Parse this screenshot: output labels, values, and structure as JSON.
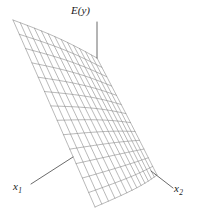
{
  "figure": {
    "type": "3d-response-surface-wireframe",
    "width": 197,
    "height": 219,
    "background_color": "#ffffff",
    "mesh_line_color": "#8a8a8a",
    "leader_line_color": "#595959",
    "text_color": "#1a1a1a"
  },
  "labels": {
    "response": "E(y)",
    "factor_1": "x",
    "factor_1_sub": "1",
    "factor_2": "x",
    "factor_2_sub": "2"
  },
  "chart_data": {
    "type": "surface",
    "title": "",
    "xlabel": "x1",
    "ylabel": "x2",
    "zlabel": "E(y)",
    "grid": true,
    "legend": false,
    "mesh_rows": 13,
    "mesh_cols": 13,
    "corners": {
      "apex_top_left": [
        13,
        20
      ],
      "top_right": [
        97,
        58
      ],
      "bottom_right": [
        157,
        175
      ],
      "bottom_left": [
        95,
        207
      ]
    },
    "leaders": [
      {
        "name": "E(y)",
        "from": [
          97,
          58
        ],
        "to": [
          97,
          22
        ]
      },
      {
        "name": "x1",
        "from": [
          73,
          157
        ],
        "to": [
          31,
          184
        ]
      },
      {
        "name": "x2",
        "from": [
          151,
          171
        ],
        "to": [
          173,
          188
        ]
      }
    ]
  }
}
